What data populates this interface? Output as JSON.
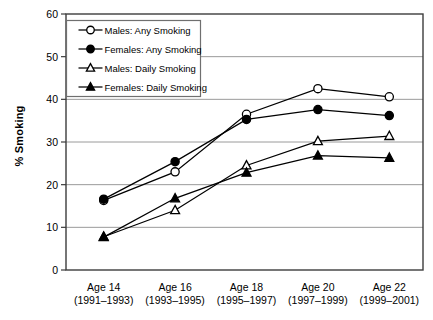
{
  "chart_data": {
    "type": "line",
    "title": "",
    "xlabel": "",
    "ylabel": "% Smoking",
    "ylim": [
      0,
      60
    ],
    "ytick_values": [
      0,
      10,
      20,
      30,
      40,
      50,
      60
    ],
    "ytick_labels": [
      "0",
      "10",
      "20",
      "30",
      "40",
      "50",
      "60"
    ],
    "grid": "horizontal",
    "legend_position": "upper-left-inside",
    "categories": [
      "Age 14",
      "Age 16",
      "Age 18",
      "Age 20",
      "Age 22"
    ],
    "category_sublabels": [
      "(1991–1993)",
      "(1993–1995)",
      "(1995–1997)",
      "(1997–1999)",
      "(1999–2001)"
    ],
    "series": [
      {
        "name": "Males: Any Smoking",
        "marker": "open-circle",
        "values": [
          16.3,
          23.0,
          36.5,
          42.5,
          40.6
        ]
      },
      {
        "name": "Females: Any Smoking",
        "marker": "filled-circle",
        "values": [
          16.6,
          25.4,
          35.3,
          37.6,
          36.2
        ]
      },
      {
        "name": "Males: Daily Smoking",
        "marker": "open-triangle",
        "values": [
          7.8,
          14.0,
          24.5,
          30.2,
          31.4
        ]
      },
      {
        "name": "Females: Daily Smoking",
        "marker": "filled-triangle",
        "values": [
          7.7,
          16.8,
          22.8,
          26.8,
          26.3
        ]
      }
    ],
    "colors": {
      "line": "#000000",
      "marker_fill_open": "#ffffff",
      "marker_fill_solid": "#000000",
      "gridline": "#9a9a9a",
      "axis": "#3d3d3d",
      "background": "#ffffff"
    }
  }
}
